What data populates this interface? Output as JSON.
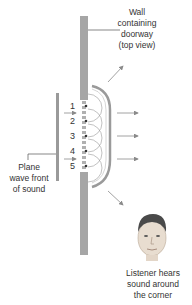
{
  "labels": {
    "wall": [
      "Wall",
      "containing",
      "doorway",
      "(top view)"
    ],
    "plane_wave": [
      "Plane",
      "wave front",
      "of sound"
    ],
    "listener": [
      "Listener hears",
      "sound around",
      "the corner"
    ]
  },
  "source_points": [
    "1",
    "2",
    "3",
    "4",
    "5"
  ],
  "colors": {
    "wall": "#a6a6a6",
    "wave": "#999999",
    "text": "#333333",
    "arrow": "#8a8a8a"
  }
}
